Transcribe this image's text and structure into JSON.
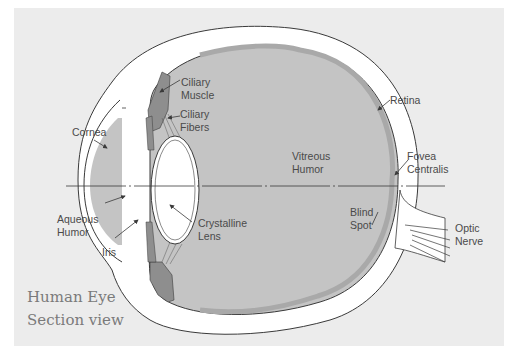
{
  "diagram": {
    "title_line1": "Human Eye",
    "title_line2": "Section view",
    "colors": {
      "background_panel": "#ececec",
      "page": "#ffffff",
      "sclera": "#ffffff",
      "outline": "#3a3a3a",
      "fluid_fill": "#c4c4c4",
      "retina_band": "#a9a9a9",
      "muscle_fill": "#8e8e8e",
      "label_text": "#4a4a4a",
      "title_text": "#7a7a7a"
    },
    "labels": {
      "ciliary_muscle": [
        "Ciliary",
        "Muscle"
      ],
      "ciliary_fibers": [
        "Ciliary",
        "Fibers"
      ],
      "cornea": "Cornea",
      "retina": "Retina",
      "vitreous_humor": [
        "Vitreous",
        "Humor"
      ],
      "fovea_centralis": [
        "Fovea",
        "Centralis"
      ],
      "aqueous_humor": [
        "Aqueous",
        "Humor"
      ],
      "crystalline_lens": [
        "Crystalline",
        "Lens"
      ],
      "blind_spot": [
        "Blind",
        "Spot"
      ],
      "optic_nerve": [
        "Optic",
        "Nerve"
      ],
      "iris": "Iris"
    }
  }
}
